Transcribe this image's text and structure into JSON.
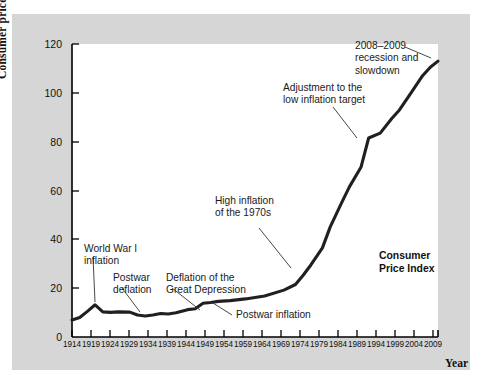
{
  "chart_data": {
    "type": "line",
    "title": "",
    "subtitle": "",
    "xlabel": "Year",
    "ylabel": "Consumer price index (2002 = 100)",
    "xlim": [
      1914,
      2009
    ],
    "ylim": [
      0,
      120
    ],
    "grid": false,
    "legend_position": "inside-right",
    "y_ticks": [
      0,
      20,
      40,
      60,
      80,
      100,
      120
    ],
    "x_ticks": [
      1914,
      1919,
      1924,
      1929,
      1934,
      1939,
      1944,
      1949,
      1954,
      1959,
      1964,
      1969,
      1974,
      1979,
      1984,
      1989,
      1994,
      1999,
      2004,
      2009
    ],
    "series": [
      {
        "name": "Consumer Price Index",
        "color": "#231f20",
        "x": [
          1914,
          1916,
          1918,
          1920,
          1922,
          1924,
          1926,
          1929,
          1931,
          1933,
          1935,
          1937,
          1939,
          1941,
          1944,
          1946,
          1948,
          1950,
          1952,
          1955,
          1959,
          1964,
          1969,
          1972,
          1974,
          1976,
          1979,
          1981,
          1984,
          1986,
          1989,
          1991,
          1994,
          1997,
          1999,
          2002,
          2005,
          2007,
          2009
        ],
        "values": [
          7.0,
          8.0,
          10.5,
          13.2,
          10.3,
          10.1,
          10.3,
          10.2,
          9.0,
          8.6,
          9.0,
          9.6,
          9.4,
          9.9,
          11.2,
          11.6,
          13.8,
          14.1,
          14.6,
          14.9,
          15.6,
          16.8,
          19.2,
          21.5,
          25.3,
          29.5,
          36.5,
          45.0,
          55.0,
          61.5,
          69.5,
          81.5,
          83.5,
          89.5,
          93.0,
          100.0,
          107.0,
          110.5,
          113.0
        ]
      }
    ],
    "annotations": [
      {
        "id": "ww1",
        "text": "World War I\ninflation"
      },
      {
        "id": "postwar-deflation",
        "text": "Postwar\ndeflation"
      },
      {
        "id": "great-depression",
        "text": "Deflation of the\nGreat Depression"
      },
      {
        "id": "postwar-inflation",
        "text": "Postwar inflation"
      },
      {
        "id": "high-inflation-1970s",
        "text": "High inflation\nof the 1970s"
      },
      {
        "id": "low-inflation-target",
        "text": "Adjustment to the\nlow inflation target"
      },
      {
        "id": "recession-2008",
        "text": "2008–2009\nrecession and\nslowdown"
      }
    ],
    "series_label": "Consumer\nPrice Index",
    "colors": {
      "line": "#231f20",
      "frame": "#d6d6d6",
      "plot_background": "#ffffff",
      "axis": "#000000",
      "text": "#111111"
    }
  }
}
